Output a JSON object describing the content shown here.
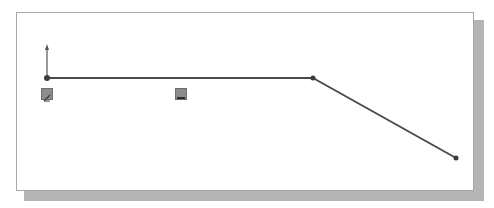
{
  "sketch": {
    "origin": {
      "x": 47,
      "y": 78
    },
    "points": [
      {
        "name": "start",
        "x": 47,
        "y": 78
      },
      {
        "name": "corner",
        "x": 313,
        "y": 78
      },
      {
        "name": "end",
        "x": 456,
        "y": 158
      }
    ],
    "segments": [
      {
        "name": "horizontal-line",
        "from": "start",
        "to": "corner"
      },
      {
        "name": "sloped-line",
        "from": "corner",
        "to": "end"
      }
    ],
    "relations": [
      {
        "type": "coincident",
        "icon": "coincident-icon",
        "x": 41,
        "y": 88
      },
      {
        "type": "horizontal",
        "icon": "horizontal-icon",
        "x": 175,
        "y": 88
      }
    ],
    "colors": {
      "line": "#4a4a4a",
      "point": "#3c3c3c",
      "axis": "#555555",
      "relation_bg": "#8c8c8c",
      "shadow": "#b4b4b4",
      "panel_border": "#a8a8a8"
    }
  }
}
